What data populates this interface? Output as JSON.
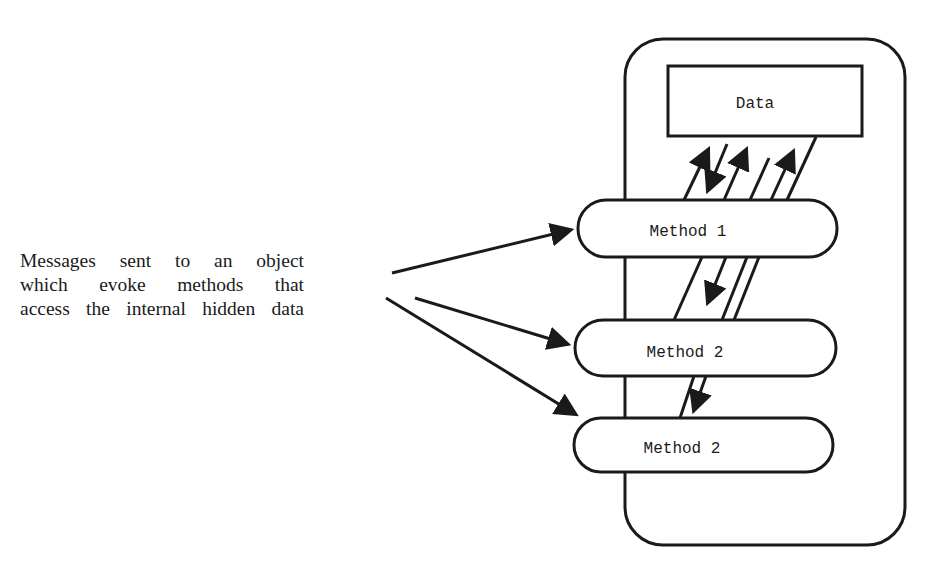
{
  "diagram": {
    "caption": {
      "lines": [
        "Messages sent to an object",
        "which evoke methods that",
        "access the internal hidden data"
      ]
    },
    "object": {
      "data_box": {
        "label": "Data"
      },
      "methods": [
        {
          "label": "Method 1"
        },
        {
          "label": "Method 2"
        },
        {
          "label": "Method 2"
        }
      ]
    },
    "colors": {
      "stroke": "#1a1a1a",
      "background": "#ffffff"
    }
  }
}
